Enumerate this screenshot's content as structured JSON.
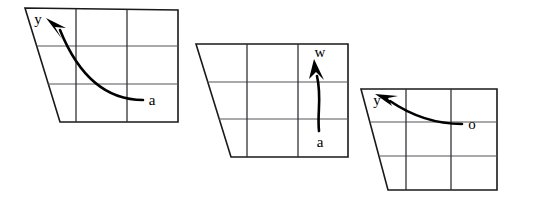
{
  "figure": {
    "background_color": "#ffffff",
    "stroke_color": "#1a1a1a",
    "grid_color": "#55545a",
    "arrow_color": "#000000",
    "panel_count": 3,
    "grid_rows": 3,
    "grid_cols": 3
  },
  "panels": [
    {
      "id": "panel-left",
      "name": "left-panel",
      "outline_points": "25,8 178,10 178,122 60,122",
      "grid_h": [
        "36.5,46 178,46",
        "48,84 178,84"
      ],
      "grid_v": [
        "76,9 76,122",
        "127,9.5 127,122"
      ],
      "arrow": {
        "id": "arrow-left",
        "path": "M 143,100 C 120,100 85,92 60,30",
        "head_points": "46,18 62,39 55,27 66,28",
        "head_tip_x": 46,
        "head_tip_y": 18,
        "source_label": "a",
        "target_label": "y",
        "source_label_x": 152,
        "source_label_y": 105,
        "target_label_x": 38,
        "target_label_y": 24
      }
    },
    {
      "id": "panel-middle",
      "name": "middle-panel",
      "outline_points": "196,44 348,44 348,157 231,157",
      "grid_h": [
        "207.5,82 348,82",
        "219,119 348,119"
      ],
      "grid_v": [
        "247,44 247,157",
        "298,44 298,157"
      ],
      "arrow": {
        "id": "arrow-middle",
        "path": "M 319,131 C 317,112 322,98 317,76",
        "head_points": "314,59 324,80 316,72 309,79",
        "head_tip_x": 314,
        "head_tip_y": 59,
        "source_label": "a",
        "target_label": "w",
        "source_label_x": 313,
        "source_label_y": 147,
        "target_label_x": 311,
        "target_label_y": 57
      }
    },
    {
      "id": "panel-right",
      "name": "right-panel",
      "outline_points": "361,89 497,89 497,190 388,190",
      "grid_h": [
        "370.5,122 497,122",
        "380,156 497,156"
      ],
      "grid_v": [
        "406,89 406,190",
        "451,89 451,190"
      ],
      "arrow": {
        "id": "arrow-right",
        "path": "M 462,124 C 434,124 412,116 390,101",
        "head_points": "375,94 398,96 388,98 392,106",
        "head_tip_x": 375,
        "head_tip_y": 94,
        "source_label": "o",
        "target_label": "y",
        "source_label_x": 469,
        "source_label_y": 129,
        "target_label_x": 371,
        "target_label_y": 105
      }
    }
  ]
}
